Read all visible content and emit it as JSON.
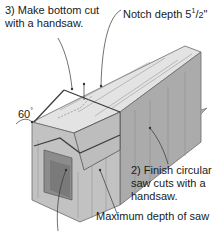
{
  "diagram": {
    "labels": {
      "step3_line1": "3) Make bottom cut",
      "step3_line2": "with a handsaw.",
      "notch_prefix": "Notch depth 5",
      "notch_num": "1",
      "notch_den": "2",
      "notch_unit": "\"",
      "angle": "60",
      "angle_unit": "°",
      "step2_line1": "2) Finish circular",
      "step2_line2": "saw cuts with a",
      "step2_line3": "handsaw.",
      "max_depth": "Maximum depth of saw"
    },
    "colors": {
      "top_face": "#d9d9d9",
      "top_face_light": "#e8e8e8",
      "front_face": "#b8b8b8",
      "side_face": "#a3a3a3",
      "notch_inner": "#8f8f8f",
      "outline": "#555555",
      "cut_line": "#444444",
      "leader": "#333333",
      "text": "#1a1a1a"
    }
  }
}
